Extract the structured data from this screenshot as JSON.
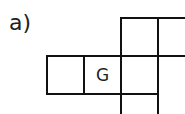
{
  "label": "a)",
  "grid": {
    "line_color": "#111111",
    "cells": [
      {
        "row": 0,
        "col": 2,
        "text": ""
      },
      {
        "row": 0,
        "col": 3,
        "text": ""
      },
      {
        "row": 1,
        "col": 0,
        "text": ""
      },
      {
        "row": 1,
        "col": 1,
        "text": "G"
      },
      {
        "row": 1,
        "col": 2,
        "text": ""
      },
      {
        "row": 1,
        "col": 3,
        "text": ""
      },
      {
        "row": 2,
        "col": 2,
        "text": ""
      }
    ],
    "marked_letter": "G"
  }
}
